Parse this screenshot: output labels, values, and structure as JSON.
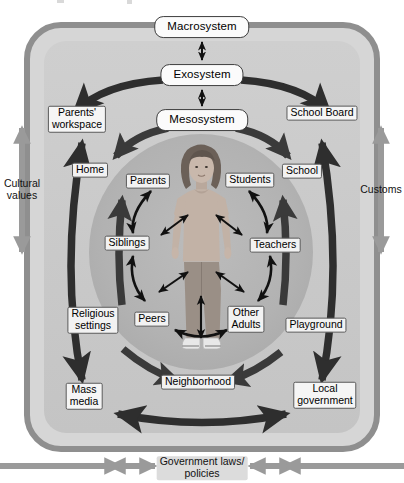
{
  "figure": {
    "center_subject": "child-photo"
  },
  "system_labels": [
    {
      "id": "macrosystem",
      "text": "Macrosystem",
      "x": 202,
      "y": 27
    },
    {
      "id": "exosystem",
      "text": "Exosystem",
      "x": 202,
      "y": 75
    },
    {
      "id": "mesosystem",
      "text": "Mesosystem",
      "x": 202,
      "y": 120
    }
  ],
  "microsystem_labels": [
    {
      "id": "parents",
      "text": "Parents",
      "x": 148,
      "y": 181
    },
    {
      "id": "students",
      "text": "Students",
      "x": 250,
      "y": 180
    },
    {
      "id": "siblings",
      "text": "Siblings",
      "x": 127,
      "y": 243
    },
    {
      "id": "teachers",
      "text": "Teachers",
      "x": 275,
      "y": 245
    },
    {
      "id": "peers",
      "text": "Peers",
      "x": 152,
      "y": 319
    },
    {
      "id": "other-adults",
      "text": "Other\nAdults",
      "x": 246,
      "y": 319
    }
  ],
  "mesosystem_labels": [
    {
      "id": "home",
      "text": "Home",
      "x": 90,
      "y": 170
    },
    {
      "id": "school",
      "text": "School",
      "x": 302,
      "y": 171
    },
    {
      "id": "religious-settings",
      "text": "Religious\nsettings",
      "x": 93,
      "y": 320
    },
    {
      "id": "playground",
      "text": "Playground",
      "x": 316,
      "y": 325
    },
    {
      "id": "neighborhood",
      "text": "Neighborhood",
      "x": 198,
      "y": 382
    }
  ],
  "exosystem_labels": [
    {
      "id": "parents-workspace",
      "text": "Parents'\nworkspace",
      "x": 77,
      "y": 119
    },
    {
      "id": "school-board",
      "text": "School Board",
      "x": 322,
      "y": 113
    },
    {
      "id": "mass-media",
      "text": "Mass\nmedia",
      "x": 84,
      "y": 396
    },
    {
      "id": "local-government",
      "text": "Local\ngovernment",
      "x": 325,
      "y": 395
    }
  ],
  "macrosystem_labels": [
    {
      "id": "cultural-values",
      "text": "Cultural\nvalues",
      "x": 22,
      "y": 190
    },
    {
      "id": "customs",
      "text": "Customs",
      "x": 381,
      "y": 190
    },
    {
      "id": "government-laws",
      "text": "Government laws/\npolicies",
      "x": 202,
      "y": 468
    }
  ],
  "colors": {
    "page_background": "#ffffff",
    "macro_border": "#8f8f8f",
    "macro_fill": "#d6d6d6",
    "exo_fill": "#c9c9c9",
    "micro_fill": "#b4b4b4",
    "arrow_dark": "#2e2e2e",
    "arrow_meso": "#3a3a3a",
    "arrow_gray": "#9a9a9a",
    "label_text": "#000000"
  }
}
